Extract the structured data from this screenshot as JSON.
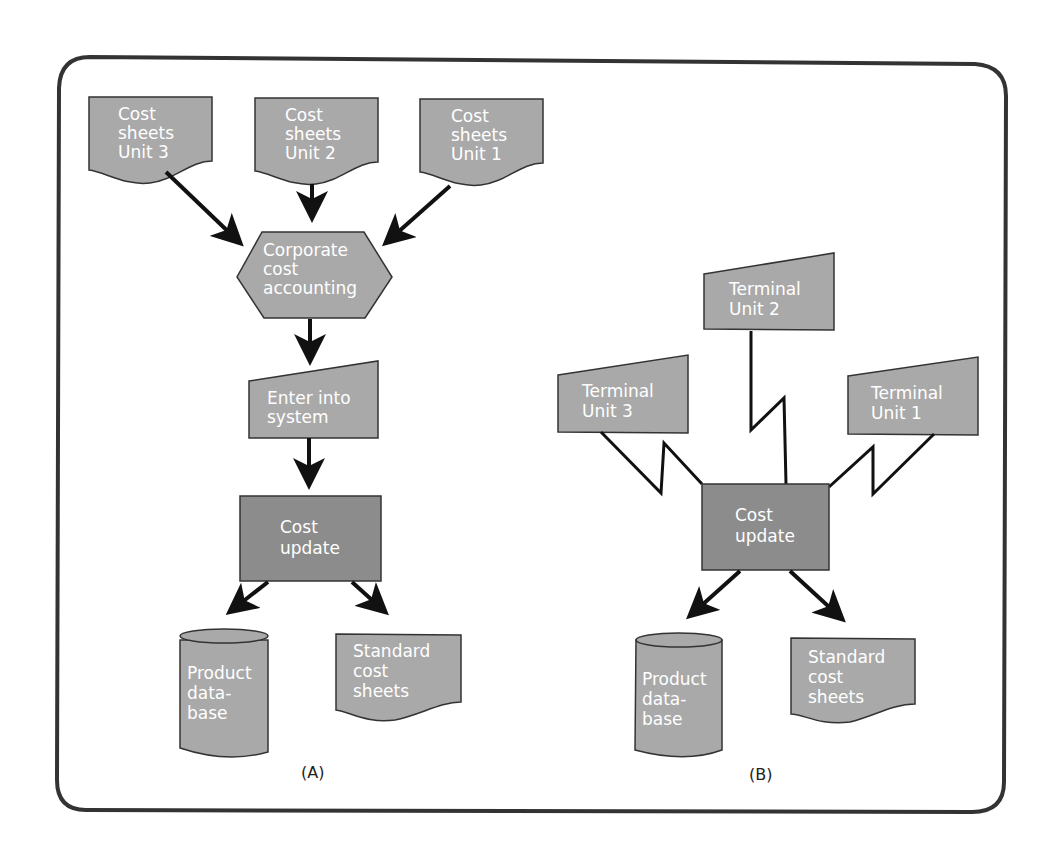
{
  "panel_a": {
    "caption": "(A)",
    "sources": [
      {
        "line1": "Cost",
        "line2": "sheets",
        "line3": "Unit 3"
      },
      {
        "line1": "Cost",
        "line2": "sheets",
        "line3": "Unit 2"
      },
      {
        "line1": "Cost",
        "line2": "sheets",
        "line3": "Unit 1"
      }
    ],
    "process": {
      "line1": "Corporate",
      "line2": "cost",
      "line3": "accounting"
    },
    "manual_input": {
      "line1": "Enter into",
      "line2": "system"
    },
    "update": {
      "line1": "Cost",
      "line2": "update"
    },
    "database": {
      "line1": "Product",
      "line2": "data-",
      "line3": "base"
    },
    "output_doc": {
      "line1": "Standard",
      "line2": "cost",
      "line3": "sheets"
    }
  },
  "panel_b": {
    "caption": "(B)",
    "terminals": [
      {
        "line1": "Terminal",
        "line2": "Unit 3"
      },
      {
        "line1": "Terminal",
        "line2": "Unit 2"
      },
      {
        "line1": "Terminal",
        "line2": "Unit 1"
      }
    ],
    "update": {
      "line1": "Cost",
      "line2": "update"
    },
    "database": {
      "line1": "Product",
      "line2": "data-",
      "line3": "base"
    },
    "output_doc": {
      "line1": "Standard",
      "line2": "cost",
      "line3": "sheets"
    }
  },
  "colors": {
    "shape_fill": "#a9a9a9",
    "process_fill": "#8c8c8c",
    "frame": "#333333"
  }
}
